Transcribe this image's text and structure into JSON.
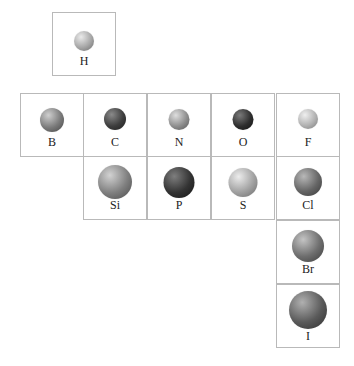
{
  "elements": [
    {
      "symbol": "H",
      "size": 20,
      "shade": "#a6a6a6",
      "col": 1.5,
      "row": 0
    },
    {
      "symbol": "B",
      "size": 24,
      "shade": "#7a7a7a",
      "col": 0,
      "row": 1
    },
    {
      "symbol": "C",
      "size": 22,
      "shade": "#3e3e3e",
      "col": 1,
      "row": 1
    },
    {
      "symbol": "N",
      "size": 21,
      "shade": "#8e8e8e",
      "col": 2,
      "row": 1
    },
    {
      "symbol": "O",
      "size": 21,
      "shade": "#2e2e2e",
      "col": 3,
      "row": 1
    },
    {
      "symbol": "F",
      "size": 20,
      "shade": "#b2b2b2",
      "col": 4,
      "row": 1
    },
    {
      "symbol": "Si",
      "size": 34,
      "shade": "#7f7f7f",
      "col": 1,
      "row": 2
    },
    {
      "symbol": "P",
      "size": 31,
      "shade": "#333333",
      "col": 2,
      "row": 2
    },
    {
      "symbol": "S",
      "size": 29,
      "shade": "#a2a2a2",
      "col": 3,
      "row": 2
    },
    {
      "symbol": "Cl",
      "size": 28,
      "shade": "#666666",
      "col": 4,
      "row": 2
    },
    {
      "symbol": "Br",
      "size": 32,
      "shade": "#6e6e6e",
      "col": 4,
      "row": 3
    },
    {
      "symbol": "I",
      "size": 38,
      "shade": "#5a5a5a",
      "col": 4,
      "row": 4
    }
  ]
}
